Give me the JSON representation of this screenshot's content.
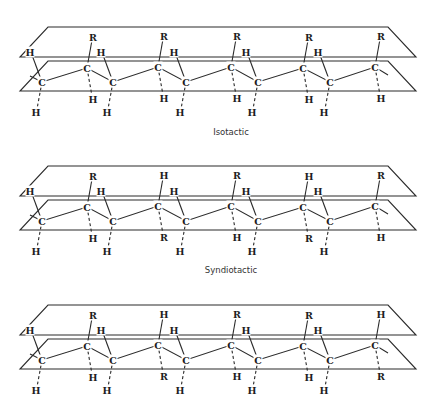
{
  "diagram": {
    "panels": [
      {
        "id": "isotactic",
        "caption": "Isotactic",
        "y_offset": 0,
        "upper_substituents": [
          "R",
          "R",
          "R",
          "R",
          "R"
        ],
        "lower_substituents": [
          "H",
          "H",
          "H",
          "H",
          "H"
        ]
      },
      {
        "id": "syndiotactic",
        "caption": "Syndiotactic",
        "y_offset": 139,
        "upper_substituents": [
          "R",
          "H",
          "R",
          "H",
          "R"
        ],
        "lower_substituents": [
          "H",
          "R",
          "H",
          "R",
          "H"
        ]
      },
      {
        "id": "atactic",
        "caption": "",
        "y_offset": 278,
        "upper_substituents": [
          "R",
          "H",
          "R",
          "R",
          "H"
        ],
        "lower_substituents": [
          "H",
          "R",
          "H",
          "H",
          "R"
        ]
      }
    ],
    "atom_labels": {
      "carbon": "C",
      "hydrogen": "H",
      "substituent": "R"
    }
  }
}
